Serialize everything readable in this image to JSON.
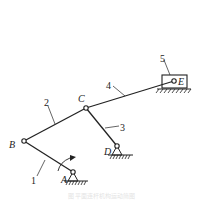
{
  "diagram": {
    "type": "planar linkage mechanism",
    "colors": {
      "line": "#222222",
      "background": "#ffffff",
      "caption": "#e4e4e4"
    },
    "joints": {
      "A": {
        "label": "A",
        "x": 73,
        "y": 172,
        "ground": true
      },
      "B": {
        "label": "B",
        "x": 24,
        "y": 141
      },
      "C": {
        "label": "C",
        "x": 86,
        "y": 108
      },
      "D": {
        "label": "D",
        "x": 117,
        "y": 146,
        "ground": true
      },
      "E": {
        "label": "E",
        "x": 174,
        "y": 81
      }
    },
    "links": [
      {
        "id": "1",
        "label": "1",
        "from": "A",
        "to": "B"
      },
      {
        "id": "2",
        "label": "2",
        "from": "B",
        "to": "C"
      },
      {
        "id": "3",
        "label": "3",
        "from": "C",
        "to": "D"
      },
      {
        "id": "4",
        "label": "4",
        "from": "C",
        "to": "E"
      },
      {
        "id": "5",
        "label": "5",
        "type": "slider",
        "at": "E"
      }
    ],
    "input": {
      "link": "1",
      "indicator": "rotation-arrow"
    },
    "caption": "图 平面连杆机构运动简图"
  }
}
